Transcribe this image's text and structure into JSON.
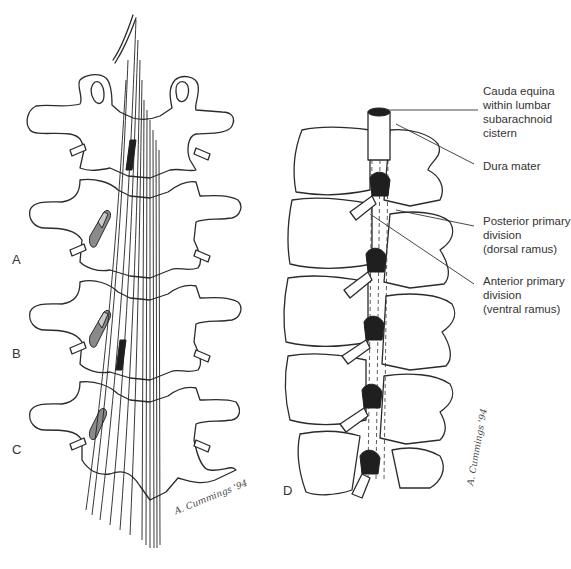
{
  "figure": {
    "panels": {
      "A": "A",
      "B": "B",
      "C": "C",
      "D": "D"
    },
    "labels": {
      "cauda_equina": "Cauda equina\nwithin lumbar\nsubarachnoid\ncistern",
      "dura_mater": "Dura mater",
      "posterior_primary": "Posterior primary\ndivision\n(dorsal ramus)",
      "anterior_primary": "Anterior primary\ndivision\n(ventral ramus)"
    },
    "signature": {
      "left": "A. Cummings '94",
      "right": "A. Cummings '94"
    },
    "colors": {
      "line": "#2b2b2b",
      "shade_dark": "#1f1f1f",
      "shade_grey": "#8a8a8a",
      "background": "#ffffff"
    }
  }
}
